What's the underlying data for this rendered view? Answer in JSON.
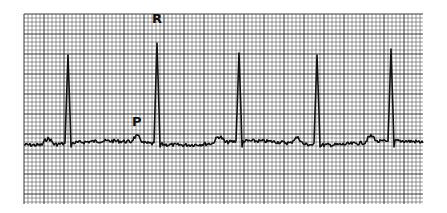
{
  "figure": {
    "type": "ecg-strip",
    "labels": {
      "r_wave": "R",
      "p_wave": "P"
    },
    "colors": {
      "background": "#ffffff",
      "grid": "#222222",
      "trace": "#111111"
    },
    "grid": {
      "x": 24,
      "y": 14,
      "width": 399,
      "height": 190,
      "minor_step": 4,
      "major_every": 5
    },
    "r_peaks_x": [
      68,
      157,
      239,
      317,
      391
    ],
    "baseline_y": 143
  }
}
